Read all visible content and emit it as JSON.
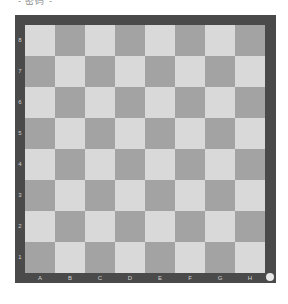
{
  "header": {
    "label": "- 密码 -"
  },
  "board": {
    "colors": {
      "light": "#d9d9d9",
      "dark": "#a3a3a3",
      "frame": "#4a4a4a"
    },
    "files": [
      "A",
      "B",
      "C",
      "D",
      "E",
      "F",
      "G",
      "H"
    ],
    "ranks": [
      "8",
      "7",
      "6",
      "5",
      "4",
      "3",
      "2",
      "1"
    ],
    "pieces": []
  },
  "corner_indicator": {
    "icon": "circle-icon"
  }
}
